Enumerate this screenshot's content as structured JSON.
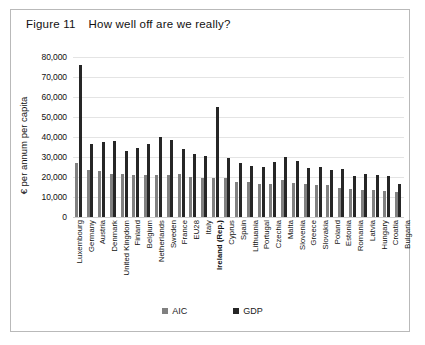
{
  "figure": {
    "number": "Figure 11",
    "title": "How well off are we really?"
  },
  "legend": {
    "position": "bottom-center",
    "items": [
      {
        "label": "AIC",
        "color": "#808080"
      },
      {
        "label": "GDP",
        "color": "#262626"
      }
    ]
  },
  "axis": {
    "ylabel": "€ per annum per capita",
    "yticks": [
      "80,000",
      "70,000",
      "60,000",
      "50,000",
      "40,000",
      "30,000",
      "20,000",
      "10,000",
      "0"
    ]
  },
  "highlight_category": "Ireland (Rep.)",
  "colors": {
    "aic": "#808080",
    "gdp": "#262626",
    "gridline": "#e4e4e4",
    "frame": "#b9b9b9",
    "text": "#111111"
  },
  "chart_data": {
    "type": "bar",
    "title": "How well off are we really?",
    "xlabel": "",
    "ylabel": "€ per annum per capita",
    "ylim": [
      0,
      80000
    ],
    "ytick_step": 10000,
    "grid": true,
    "legend_position": "bottom-center",
    "categories": [
      "Luxembourg",
      "Germany",
      "Austria",
      "Denmark",
      "United Kingdom",
      "Finland",
      "Belgium",
      "Netherlands",
      "Sweden",
      "France",
      "EU28",
      "Italy",
      "Ireland (Rep.)",
      "Cyprus",
      "Spain",
      "Lithuania",
      "Portugal",
      "Czechia",
      "Malta",
      "Slovenia",
      "Greece",
      "Slovakia",
      "Poland",
      "Estonia",
      "Romania",
      "Latvia",
      "Hungary",
      "Croatia",
      "Bulgaria"
    ],
    "series": [
      {
        "name": "AIC",
        "color": "#808080",
        "values": [
          27000,
          23500,
          23000,
          21500,
          21500,
          21000,
          21000,
          21000,
          21000,
          21500,
          20000,
          19500,
          19500,
          19500,
          17500,
          17500,
          16500,
          16500,
          18500,
          17000,
          16500,
          16000,
          16000,
          14500,
          14000,
          13500,
          13500,
          13000,
          12500
        ]
      },
      {
        "name": "GDP",
        "color": "#262626",
        "values": [
          76000,
          36500,
          37500,
          38000,
          33000,
          34500,
          36500,
          40000,
          38500,
          34000,
          31500,
          30500,
          55000,
          29500,
          27000,
          25500,
          25000,
          27500,
          30000,
          28000,
          24500,
          25000,
          23500,
          24000,
          20500,
          21500,
          21000,
          20500,
          16500
        ]
      }
    ]
  }
}
